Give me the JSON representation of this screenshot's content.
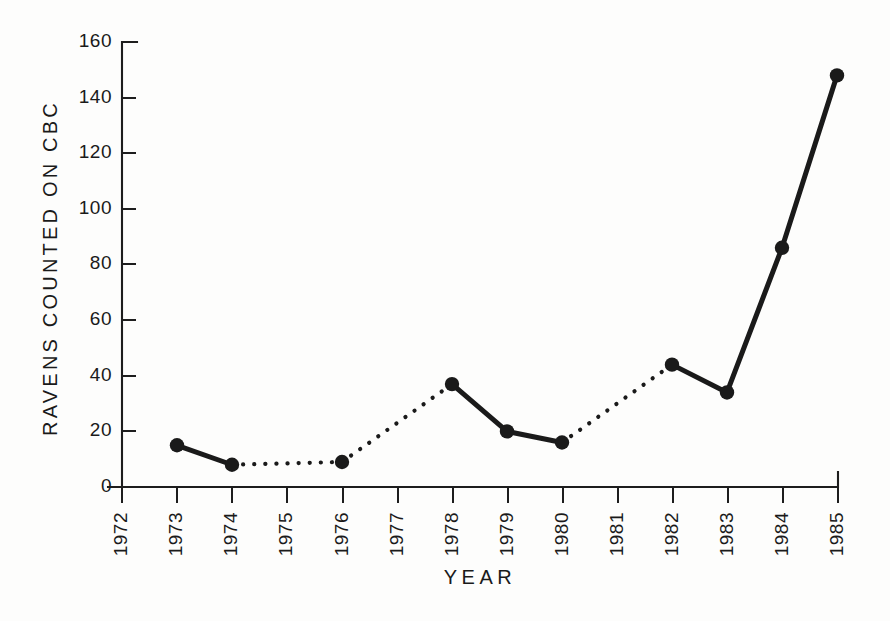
{
  "chart_data": {
    "type": "line",
    "title": "",
    "xlabel": "YEAR",
    "ylabel": "RAVENS COUNTED ON CBC",
    "categories": [
      "1972",
      "1973",
      "1974",
      "1975",
      "1976",
      "1977",
      "1978",
      "1979",
      "1980",
      "1981",
      "1982",
      "1983",
      "1984",
      "1985"
    ],
    "x": [
      1972,
      1973,
      1974,
      1975,
      1976,
      1977,
      1978,
      1979,
      1980,
      1981,
      1982,
      1983,
      1984,
      1985
    ],
    "values": [
      null,
      15,
      8,
      null,
      9,
      null,
      37,
      20,
      16,
      null,
      44,
      34,
      86,
      148
    ],
    "points": [
      {
        "year": "1973",
        "value": 15
      },
      {
        "year": "1974",
        "value": 8
      },
      {
        "year": "1976",
        "value": 9
      },
      {
        "year": "1978",
        "value": 37
      },
      {
        "year": "1979",
        "value": 20
      },
      {
        "year": "1980",
        "value": 16
      },
      {
        "year": "1982",
        "value": 44
      },
      {
        "year": "1983",
        "value": 34
      },
      {
        "year": "1984",
        "value": 86
      },
      {
        "year": "1985",
        "value": 148
      }
    ],
    "segments": [
      {
        "from": "1973",
        "to": "1974",
        "style": "solid"
      },
      {
        "from": "1974",
        "to": "1976",
        "style": "dotted"
      },
      {
        "from": "1976",
        "to": "1978",
        "style": "dotted"
      },
      {
        "from": "1978",
        "to": "1979",
        "style": "solid"
      },
      {
        "from": "1979",
        "to": "1980",
        "style": "solid"
      },
      {
        "from": "1980",
        "to": "1982",
        "style": "dotted"
      },
      {
        "from": "1982",
        "to": "1983",
        "style": "solid"
      },
      {
        "from": "1983",
        "to": "1984",
        "style": "solid"
      },
      {
        "from": "1984",
        "to": "1985",
        "style": "solid"
      }
    ],
    "ylim": [
      0,
      160
    ],
    "yticks": [
      0,
      20,
      40,
      60,
      80,
      100,
      120,
      140,
      160
    ],
    "ytick_labels": [
      "0",
      "20",
      "40",
      "60",
      "80",
      "100",
      "120",
      "140",
      "160"
    ],
    "xlim": [
      1972,
      1985
    ],
    "grid": false,
    "legend": null,
    "marker": "filled-circle",
    "series_color": "#1a1a1a",
    "missing_years": [
      "1972",
      "1975",
      "1977",
      "1981"
    ],
    "note_line_styles": "solid between consecutive surveyed years; dotted across gap years with no count"
  },
  "figure": {
    "background_color": "#fdfdfc",
    "ink_color": "#1a1a1a"
  }
}
